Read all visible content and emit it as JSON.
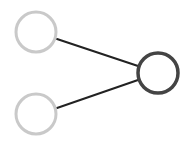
{
  "diagram": {
    "type": "node-link",
    "width": 194,
    "height": 143,
    "background": "#ffffff",
    "nodes": [
      {
        "id": "input-top",
        "cx": 36,
        "cy": 32,
        "r": 20,
        "stroke": "#c9c9c9",
        "stroke_width": 3,
        "fill": "#ffffff"
      },
      {
        "id": "input-bottom",
        "cx": 36,
        "cy": 114,
        "r": 20,
        "stroke": "#c9c9c9",
        "stroke_width": 3,
        "fill": "#ffffff"
      },
      {
        "id": "output",
        "cx": 158,
        "cy": 73,
        "r": 20,
        "stroke": "#444444",
        "stroke_width": 3.5,
        "fill": "#ffffff"
      }
    ],
    "edges": [
      {
        "from": "input-top",
        "to": "output",
        "x1": 57,
        "y1": 39,
        "x2": 138,
        "y2": 66,
        "stroke": "#222222",
        "stroke_width": 2
      },
      {
        "from": "input-bottom",
        "to": "output",
        "x1": 57,
        "y1": 108,
        "x2": 138,
        "y2": 80,
        "stroke": "#222222",
        "stroke_width": 2
      }
    ]
  }
}
